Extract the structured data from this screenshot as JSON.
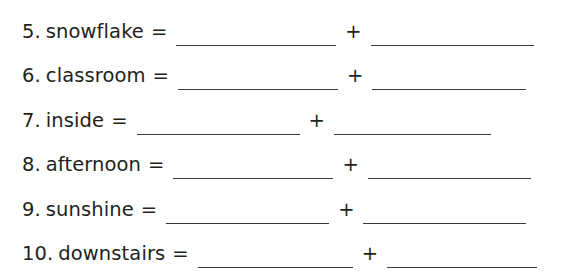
{
  "worksheet": {
    "background_color": "#ffffff",
    "text_color": "#231f20",
    "rule_color": "#3a3a3c",
    "equals_symbol": "=",
    "plus_symbol": "+",
    "problems": [
      {
        "number": "5.",
        "word": "snowflake",
        "equals": "=",
        "plus": "+",
        "blank1_value": "",
        "blank2_value": "",
        "blank1_width": 160,
        "blank2_width": 163
      },
      {
        "number": "6.",
        "word": "classroom",
        "equals": "=",
        "plus": "+",
        "blank1_value": "",
        "blank2_value": "",
        "blank1_width": 160,
        "blank2_width": 154
      },
      {
        "number": "7.",
        "word": "inside",
        "equals": "=",
        "plus": "+",
        "blank1_value": "",
        "blank2_value": "",
        "blank1_width": 163,
        "blank2_width": 157
      },
      {
        "number": "8.",
        "word": "afternoon",
        "equals": "=",
        "plus": "+",
        "blank1_value": "",
        "blank2_value": "",
        "blank1_width": 160,
        "blank2_width": 163
      },
      {
        "number": "9.",
        "word": "sunshine",
        "equals": "=",
        "plus": "+",
        "blank1_value": "",
        "blank2_value": "",
        "blank1_width": 163,
        "blank2_width": 163
      },
      {
        "number": "10.",
        "word": "downstairs",
        "equals": "=",
        "plus": "+",
        "blank1_value": "",
        "blank2_value": "",
        "blank1_width": 155,
        "blank2_width": 150
      }
    ]
  }
}
